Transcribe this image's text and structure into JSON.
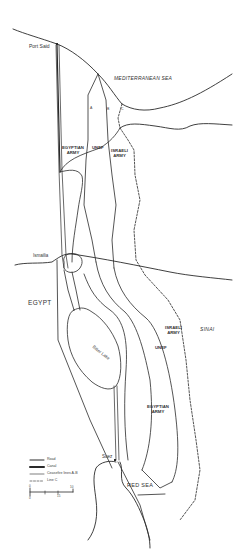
{
  "map": {
    "colors": {
      "ink": "#2a2a2a",
      "background": "#ffffff"
    },
    "labels": {
      "mediterranean": "MEDITERRANEAN SEA",
      "red_sea": "RED SEA",
      "egypt": "EGYPT",
      "sinai": "SINAI",
      "port_said": "Port Said",
      "ismailia": "Ismailia",
      "suez": "Suez",
      "bitter_lake": "Bitter Lake",
      "line_a": "A",
      "line_b": "B",
      "line_c": "C",
      "egyptian_army_north_1": "EGYPTIAN",
      "egyptian_army_north_2": "ARMY",
      "unef_north": "UNEF",
      "israeli_army_north_1": "ISRAELI",
      "israeli_army_north_2": "ARMY",
      "israeli_army_south_1": "ISRAELI",
      "israeli_army_south_2": "ARMY",
      "unef_south": "UNEF",
      "egyptian_army_south_1": "EGYPTIAN",
      "egyptian_army_south_2": "ARMY"
    },
    "legend": {
      "items": [
        {
          "symbol": "road",
          "label": "Road"
        },
        {
          "symbol": "canal",
          "label": "Canal"
        },
        {
          "symbol": "ceasefire",
          "label": "Ceasefire lines A-B"
        },
        {
          "symbol": "line-c",
          "label": "Line C"
        }
      ],
      "scale": {
        "top_start": "0",
        "top_end": "10",
        "bottom_start": "0",
        "bottom_end": "15"
      }
    }
  }
}
